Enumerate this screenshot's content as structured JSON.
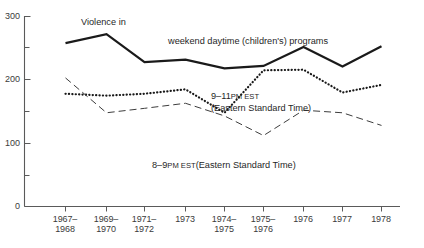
{
  "chart_data": {
    "type": "line",
    "title": "",
    "xlabel": "",
    "ylabel": "",
    "ylim": [
      0,
      300
    ],
    "yticks": [
      0,
      100,
      200,
      300
    ],
    "ytick_labels": [
      "0",
      "100",
      "200",
      "300"
    ],
    "yminor_ticks": [
      50,
      150,
      250
    ],
    "grid": false,
    "legend_position": "inline-annotations",
    "categories": [
      "1967-1968",
      "1969-1970",
      "1971-1972",
      "1973",
      "1974-1975",
      "1975-1976",
      "1976",
      "1977",
      "1978"
    ],
    "category_lines": [
      [
        "1967-",
        "1968"
      ],
      [
        "1969-",
        "1970"
      ],
      [
        "1971-",
        "1972"
      ],
      [
        "1973",
        ""
      ],
      [
        "1974-",
        "1975"
      ],
      [
        "1975-",
        "1976"
      ],
      [
        "1976",
        ""
      ],
      [
        "1977",
        ""
      ],
      [
        "1978",
        ""
      ]
    ],
    "series": [
      {
        "name": "weekend daytime (children's) programs",
        "style": "solid",
        "values": [
          258,
          272,
          228,
          232,
          218,
          222,
          252,
          221,
          253
        ]
      },
      {
        "name": "9-11 PM EST (Eastern Standard Time)",
        "style": "dotted",
        "values": [
          178,
          175,
          178,
          185,
          148,
          215,
          216,
          180,
          192
        ]
      },
      {
        "name": "8-9 PM EST (Eastern Standard Time)",
        "style": "dashed",
        "values": [
          203,
          148,
          155,
          163,
          143,
          112,
          152,
          148,
          128
        ]
      }
    ],
    "annotations": [
      {
        "id": "violence-in",
        "text": "Violence in"
      },
      {
        "id": "weekend-daytime",
        "text": "weekend daytime (children's) programs"
      },
      {
        "id": "nine-eleven-pm-line1",
        "text": "9–11 PM EST"
      },
      {
        "id": "nine-eleven-pm-line2",
        "text": "(Eastern Standard Time)"
      },
      {
        "id": "eight-nine-pm",
        "text": "8–9 PM EST (Eastern Standard Time)"
      }
    ]
  },
  "axis": {
    "y_tick_300": "300",
    "y_tick_200": "200",
    "y_tick_100": "100",
    "y_tick_0": "0"
  },
  "x_labels": [
    {
      "line1": "1967–",
      "line2": "1968"
    },
    {
      "line1": "1969–",
      "line2": "1970"
    },
    {
      "line1": "1971–",
      "line2": "1972"
    },
    {
      "line1": "1973",
      "line2": ""
    },
    {
      "line1": "1974–",
      "line2": "1975"
    },
    {
      "line1": "1975–",
      "line2": "1976"
    },
    {
      "line1": "1976",
      "line2": ""
    },
    {
      "line1": "1977",
      "line2": ""
    },
    {
      "line1": "1978",
      "line2": ""
    }
  ],
  "annotations": {
    "violence_in": "Violence in",
    "weekend_daytime": "weekend daytime (children's) programs",
    "nine_to_eleven_num": "9–11",
    "nine_to_eleven_caps": "PM EST",
    "nine_to_eleven_expand": "(Eastern Standard Time)",
    "eight_to_nine_num": "8–9",
    "eight_to_nine_caps": "PM EST",
    "eight_to_nine_expand": "(Eastern Standard Time)"
  },
  "colors": {
    "axis": "#5a5a5a",
    "solid_series": "#1a1a1a",
    "dotted_series": "#1a1a1a",
    "dashed_series": "#3d3d3d",
    "text": "#1f1f1f",
    "background": "#ffffff"
  }
}
